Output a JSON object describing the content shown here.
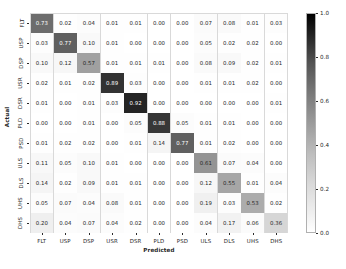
{
  "chart_data": {
    "type": "heatmap",
    "title": "",
    "xlabel": "Predicted",
    "ylabel": "Actual",
    "categories": [
      "FLT",
      "USP",
      "DSP",
      "USR",
      "DSR",
      "PLD",
      "PSD",
      "ULS",
      "DLS",
      "UHS",
      "DHS"
    ],
    "x_tick_labels": [
      "FLT",
      "USP",
      "DSP",
      "USR",
      "DSR",
      "PLD",
      "PSD",
      "ULS",
      "DLS",
      "UHS",
      "DHS"
    ],
    "y_tick_labels": [
      "FLT",
      "USP",
      "DSP",
      "USR",
      "DSR",
      "PLD",
      "PSD",
      "ULS",
      "DLS",
      "UHS",
      "DHS"
    ],
    "colormap": "Greys",
    "colorbar": {
      "min": 0.0,
      "max": 1.0,
      "ticks": [
        "0.0",
        "0.2",
        "0.4",
        "0.6",
        "0.8",
        "1.0"
      ],
      "tick_values": [
        0.0,
        0.2,
        0.4,
        0.6,
        0.8,
        1.0
      ],
      "position": "right"
    },
    "zlim": [
      0.0,
      1.0
    ],
    "grid": true,
    "annotated": true,
    "rows": [
      {
        "label": "FLT",
        "values": [
          0.73,
          0.02,
          0.04,
          0.01,
          0.01,
          0.0,
          0.0,
          0.07,
          0.08,
          0.01,
          0.03
        ]
      },
      {
        "label": "USP",
        "values": [
          0.03,
          0.77,
          0.1,
          0.01,
          0.0,
          0.0,
          0.0,
          0.05,
          0.02,
          0.02,
          0.0
        ]
      },
      {
        "label": "DSP",
        "values": [
          0.1,
          0.12,
          0.57,
          0.01,
          0.01,
          0.01,
          0.0,
          0.08,
          0.09,
          0.02,
          0.01
        ]
      },
      {
        "label": "USR",
        "values": [
          0.02,
          0.01,
          0.02,
          0.89,
          0.03,
          0.0,
          0.0,
          0.01,
          0.01,
          0.02,
          0.0
        ]
      },
      {
        "label": "DSR",
        "values": [
          0.01,
          0.0,
          0.01,
          0.03,
          0.92,
          0.0,
          0.0,
          0.0,
          0.0,
          0.0,
          0.01
        ]
      },
      {
        "label": "PLD",
        "values": [
          0.0,
          0.0,
          0.01,
          0.0,
          0.05,
          0.88,
          0.05,
          0.01,
          0.01,
          0.0,
          0.0
        ]
      },
      {
        "label": "PSD",
        "values": [
          0.01,
          0.02,
          0.02,
          0.0,
          0.01,
          0.14,
          0.77,
          0.01,
          0.02,
          0.0,
          0.0
        ]
      },
      {
        "label": "ULS",
        "values": [
          0.11,
          0.05,
          0.1,
          0.01,
          0.0,
          0.0,
          0.0,
          0.61,
          0.07,
          0.04,
          0.0
        ]
      },
      {
        "label": "DLS",
        "values": [
          0.14,
          0.02,
          0.09,
          0.01,
          0.01,
          0.0,
          0.0,
          0.12,
          0.55,
          0.01,
          0.04
        ]
      },
      {
        "label": "UHS",
        "values": [
          0.05,
          0.07,
          0.04,
          0.08,
          0.01,
          0.0,
          0.0,
          0.19,
          0.03,
          0.53,
          0.02
        ]
      },
      {
        "label": "DHS",
        "values": [
          0.2,
          0.04,
          0.07,
          0.04,
          0.02,
          0.0,
          0.0,
          0.04,
          0.17,
          0.06,
          0.36
        ]
      }
    ],
    "cell_labels": [
      [
        "0.73",
        "0.02",
        "0.04",
        "0.01",
        "0.01",
        "0.00",
        "0.00",
        "0.07",
        "0.08",
        "0.01",
        "0.03"
      ],
      [
        "0.03",
        "0.77",
        "0.10",
        "0.01",
        "0.00",
        "0.00",
        "0.00",
        "0.05",
        "0.02",
        "0.02",
        "0.00"
      ],
      [
        "0.10",
        "0.12",
        "0.57",
        "0.01",
        "0.01",
        "0.01",
        "0.00",
        "0.08",
        "0.09",
        "0.02",
        "0.01"
      ],
      [
        "0.02",
        "0.01",
        "0.02",
        "0.89",
        "0.03",
        "0.00",
        "0.00",
        "0.01",
        "0.01",
        "0.02",
        "0.00"
      ],
      [
        "0.01",
        "0.00",
        "0.01",
        "0.03",
        "0.92",
        "0.00",
        "0.00",
        "0.00",
        "0.00",
        "0.00",
        "0.01"
      ],
      [
        "0.00",
        "0.00",
        "0.01",
        "0.00",
        "0.05",
        "0.88",
        "0.05",
        "0.01",
        "0.01",
        "0.00",
        "0.00"
      ],
      [
        "0.01",
        "0.02",
        "0.02",
        "0.00",
        "0.01",
        "0.14",
        "0.77",
        "0.01",
        "0.02",
        "0.00",
        "0.00"
      ],
      [
        "0.11",
        "0.05",
        "0.10",
        "0.01",
        "0.00",
        "0.00",
        "0.00",
        "0.61",
        "0.07",
        "0.04",
        "0.00"
      ],
      [
        "0.14",
        "0.02",
        "0.09",
        "0.01",
        "0.01",
        "0.00",
        "0.00",
        "0.12",
        "0.55",
        "0.01",
        "0.04"
      ],
      [
        "0.05",
        "0.07",
        "0.04",
        "0.08",
        "0.01",
        "0.00",
        "0.00",
        "0.19",
        "0.03",
        "0.53",
        "0.02"
      ],
      [
        "0.20",
        "0.04",
        "0.07",
        "0.04",
        "0.02",
        "0.00",
        "0.00",
        "0.04",
        "0.17",
        "0.06",
        "0.36"
      ]
    ]
  },
  "colors": {
    "grid_line": "#d9d9d9",
    "text_dark": "#262626",
    "text_light": "#ffffff",
    "background": "#ffffff"
  }
}
